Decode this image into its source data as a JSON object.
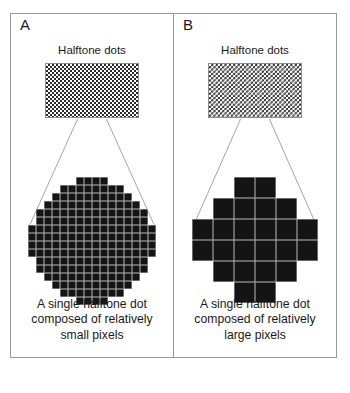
{
  "figure": {
    "panels": [
      {
        "letter": "A",
        "swatch_title": "Halftone dots",
        "swatch_pattern": "checkerboard-fine",
        "caption": "A single halftone dot composed of relatively small pixels",
        "caption_lines": [
          "A single halftone dot",
          "composed of relatively",
          "small pixels"
        ],
        "magnified_dot": {
          "grid": 16,
          "shape": "circle",
          "pixel_size": "small",
          "row_fill_counts": [
            4,
            8,
            10,
            12,
            14,
            14,
            16,
            16,
            16,
            16,
            14,
            14,
            12,
            10,
            8,
            4
          ]
        }
      },
      {
        "letter": "B",
        "swatch_title": "Halftone dots",
        "swatch_pattern": "checkerboard-coarse",
        "caption": "A single halftone dot composed of relatively large pixels",
        "caption_lines": [
          "A single halftone dot",
          "composed of relatively",
          "large pixels"
        ],
        "magnified_dot": {
          "grid": 6,
          "shape": "octagon",
          "pixel_size": "large",
          "row_fill_counts": [
            2,
            4,
            6,
            6,
            4,
            2
          ]
        }
      }
    ],
    "colors": {
      "ink": "#141414",
      "frame": "#9a9a9a",
      "leader_line": "#8f8f8f",
      "text": "#1a1a1a",
      "background": "#ffffff"
    }
  }
}
